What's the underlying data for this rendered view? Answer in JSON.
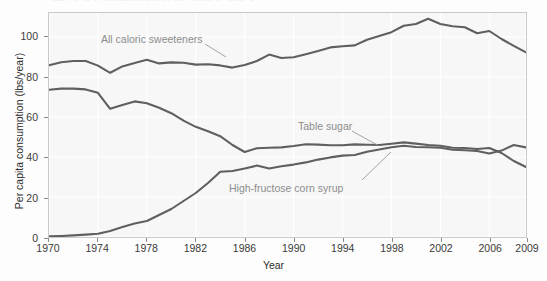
{
  "chart_data": {
    "type": "line",
    "title": "Sweetener consumption in the United States",
    "xlabel": "Year",
    "ylabel": "Per capita consumption (lbs/year)",
    "xlim": [
      1970,
      2009
    ],
    "ylim": [
      0,
      112
    ],
    "xticks": [
      1970,
      1974,
      1978,
      1982,
      1986,
      1990,
      1994,
      1998,
      2002,
      2006,
      2009
    ],
    "yticks": [
      0,
      20,
      40,
      60,
      80,
      100
    ],
    "grid": true,
    "legend_position": "inline-annotations",
    "line_color": "#5f5f5f",
    "annotation_color": "#8d8d8d",
    "plot_background": "#f7f7f7",
    "x": [
      1970,
      1971,
      1972,
      1973,
      1974,
      1975,
      1976,
      1977,
      1978,
      1979,
      1980,
      1981,
      1982,
      1983,
      1984,
      1985,
      1986,
      1987,
      1988,
      1989,
      1990,
      1991,
      1992,
      1993,
      1994,
      1995,
      1996,
      1997,
      1998,
      1999,
      2000,
      2001,
      2002,
      2003,
      2004,
      2005,
      2006,
      2007,
      2008,
      2009
    ],
    "series": [
      {
        "name": "All caloric sweeteners",
        "values": [
          85.9,
          87.4,
          88.0,
          88.0,
          85.7,
          82.1,
          85.3,
          87.0,
          88.6,
          86.8,
          87.3,
          87.1,
          86.2,
          86.4,
          85.8,
          84.7,
          86.0,
          88.0,
          91.2,
          89.5,
          89.9,
          91.4,
          93.0,
          94.8,
          95.4,
          95.8,
          98.6,
          100.5,
          102.4,
          105.6,
          106.5,
          109.1,
          106.5,
          105.4,
          104.9,
          101.9,
          103.0,
          99.0,
          95.6,
          92.3
        ]
      },
      {
        "name": "Table sugar",
        "values": [
          73.6,
          74.2,
          74.2,
          73.8,
          72.1,
          64.1,
          66.0,
          67.8,
          66.9,
          64.6,
          61.9,
          58.2,
          55.1,
          52.9,
          50.4,
          46.0,
          42.5,
          44.4,
          44.6,
          44.8,
          45.5,
          46.4,
          46.2,
          45.9,
          45.9,
          46.3,
          46.1,
          46.0,
          46.6,
          47.3,
          46.7,
          46.0,
          45.6,
          44.6,
          44.5,
          44.0,
          44.5,
          42.0,
          38.0,
          35.0
        ]
      },
      {
        "name": "High-fructose corn syrup",
        "values": [
          0.3,
          0.5,
          0.8,
          1.2,
          1.6,
          3.0,
          5.0,
          6.7,
          8.0,
          11.0,
          14.0,
          18.0,
          22.0,
          27.0,
          32.6,
          33.0,
          34.3,
          35.7,
          34.3,
          35.4,
          36.2,
          37.3,
          38.7,
          39.8,
          40.7,
          41.0,
          42.6,
          43.8,
          44.9,
          45.6,
          45.0,
          44.9,
          44.6,
          43.6,
          43.4,
          43.0,
          41.7,
          43.2,
          46.0,
          44.8
        ]
      }
    ],
    "annotations": [
      {
        "text": "All caloric sweeteners",
        "id": "all-caloric-sweeteners"
      },
      {
        "text": "Table sugar",
        "id": "table-sugar"
      },
      {
        "text": "High-fructose corn syrup",
        "id": "high-fructose-corn-syrup"
      }
    ]
  }
}
